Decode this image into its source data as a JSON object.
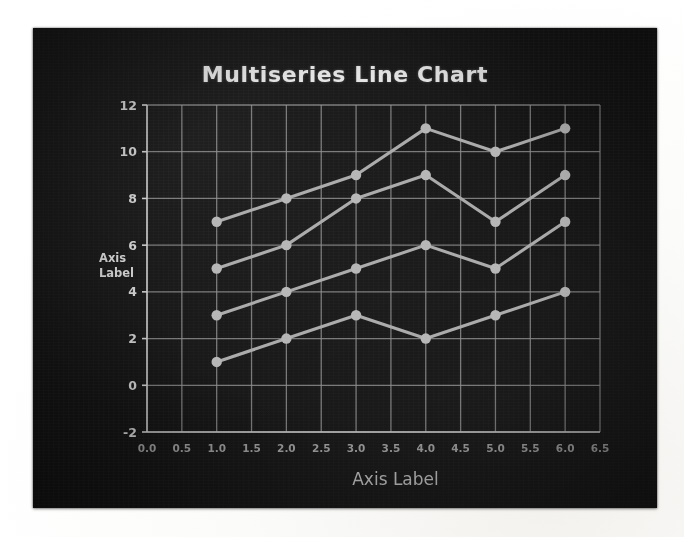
{
  "photo": {
    "caption_region": "photograph-of-screen",
    "background_color": "#141414"
  },
  "chart_data": {
    "type": "line",
    "title": "Multiseries Line Chart",
    "xlabel": "Axis Label",
    "ylabel": "Axis Label",
    "ylabel_lines": [
      "Axis",
      "Label"
    ],
    "x": [
      1.0,
      2.0,
      3.0,
      4.0,
      5.0,
      6.0
    ],
    "xlim": [
      0.0,
      6.5
    ],
    "ylim": [
      -2,
      12
    ],
    "xticks": [
      "0.0",
      "0.5",
      "1.0",
      "1.5",
      "2.0",
      "2.5",
      "3.0",
      "3.5",
      "4.0",
      "4.5",
      "5.0",
      "5.5",
      "6.0",
      "6.5"
    ],
    "xtick_values": [
      0.0,
      0.5,
      1.0,
      1.5,
      2.0,
      2.5,
      3.0,
      3.5,
      4.0,
      4.5,
      5.0,
      5.5,
      6.0,
      6.5
    ],
    "yticks": [
      "-2",
      "0",
      "2",
      "4",
      "6",
      "8",
      "10",
      "12"
    ],
    "ytick_values": [
      -2,
      0,
      2,
      4,
      6,
      8,
      10,
      12
    ],
    "grid": true,
    "legend": false,
    "legend_position": "none",
    "series": [
      {
        "name": "Series 1",
        "values": [
          7,
          8,
          9,
          11,
          10,
          11
        ],
        "color": "#a8a8a8"
      },
      {
        "name": "Series 2",
        "values": [
          5,
          6,
          8,
          9,
          7,
          9
        ],
        "color": "#a8a8a8"
      },
      {
        "name": "Series 3",
        "values": [
          3,
          4,
          5,
          6,
          5,
          7
        ],
        "color": "#a8a8a8"
      },
      {
        "name": "Series 4",
        "values": [
          1,
          2,
          3,
          2,
          3,
          4
        ],
        "color": "#a8a8a8"
      }
    ],
    "marker": "circle",
    "line_color": "#a8a8a8",
    "grid_color": "#8d8d8d",
    "text_color": "#cfcfcf",
    "title_color": "#e3e3e3"
  }
}
